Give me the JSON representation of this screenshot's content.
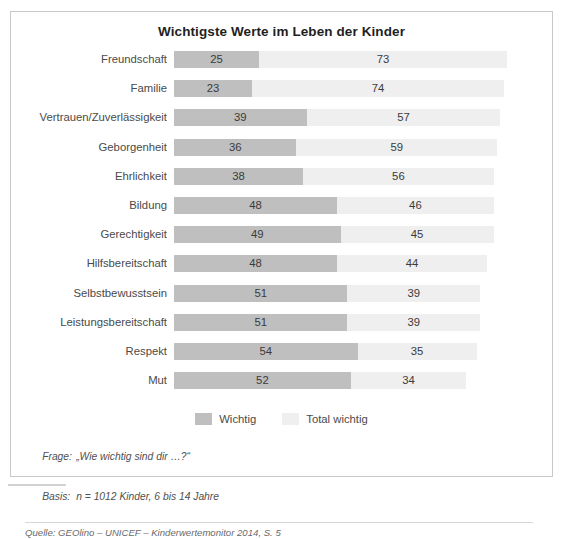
{
  "chart_data": {
    "type": "bar",
    "orientation": "horizontal",
    "stacked": true,
    "title": "Wichtigste Werte im Leben der Kinder",
    "xlabel": "",
    "ylabel": "",
    "xlim": [
      0,
      100
    ],
    "grid": false,
    "legend_position": "bottom-center",
    "categories": [
      "Freundschaft",
      "Familie",
      "Vertrauen/Zuverlässigkeit",
      "Geborgenheit",
      "Ehrlichkeit",
      "Bildung",
      "Gerechtigkeit",
      "Hilfsbereitschaft",
      "Selbstbewusstsein",
      "Leistungsbereitschaft",
      "Respekt",
      "Mut"
    ],
    "series": [
      {
        "name": "Wichtig",
        "color": "#bfbfbf",
        "values": [
          25,
          23,
          39,
          36,
          38,
          48,
          49,
          48,
          51,
          51,
          54,
          52
        ]
      },
      {
        "name": "Total wichtig",
        "color": "#efefef",
        "values": [
          73,
          74,
          57,
          59,
          56,
          46,
          45,
          44,
          39,
          39,
          35,
          34
        ]
      }
    ]
  },
  "legend": {
    "items": [
      {
        "label": "Wichtig",
        "swatch": "dark"
      },
      {
        "label": "Total wichtig",
        "swatch": "light"
      }
    ]
  },
  "footnotes": {
    "question_label": "Frage:",
    "question_text": "„Wie wichtig sind dir …?“",
    "basis_label": "Basis:",
    "basis_text": "n = 1012 Kinder, 6 bis 14 Jahre",
    "source": "Quelle: GEOlino – UNICEF – Kinderwertemonitor 2014, S. 5"
  }
}
